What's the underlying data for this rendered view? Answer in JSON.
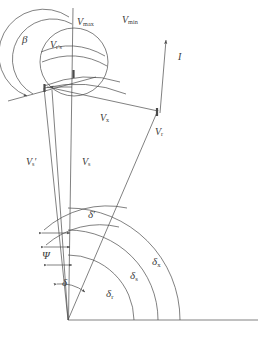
{
  "figure": {
    "type": "vector-angle-diagram",
    "background_color": "#ffffff",
    "stroke_color": "#4a4a4a",
    "text_color": "#3b3b3b",
    "width": 265,
    "height": 338,
    "labels": {
      "v_max": {
        "base": "V",
        "sub": "max"
      },
      "v_min": {
        "base": "V",
        "sub": "min"
      },
      "v_rs": {
        "base": "V",
        "sub": "r's"
      },
      "v_x": {
        "base": "V",
        "sub": "x"
      },
      "v_r": {
        "base": "V",
        "sub": "r"
      },
      "v_s_prime": {
        "base": "V",
        "sub": "s",
        "prime": "′"
      },
      "v_s": {
        "base": "V",
        "sub": "s"
      },
      "beta": {
        "base": "β"
      },
      "psi": {
        "base": "Ψ"
      },
      "delta": {
        "base": "δ"
      },
      "delta_prime": {
        "base": "δ",
        "prime": "′"
      },
      "delta_r": {
        "base": "δ",
        "sub": "r"
      },
      "delta_s": {
        "base": "δ",
        "sub": "s"
      },
      "delta_x": {
        "base": "δ",
        "sub": "x"
      },
      "inclination": {
        "base": "I"
      }
    }
  }
}
